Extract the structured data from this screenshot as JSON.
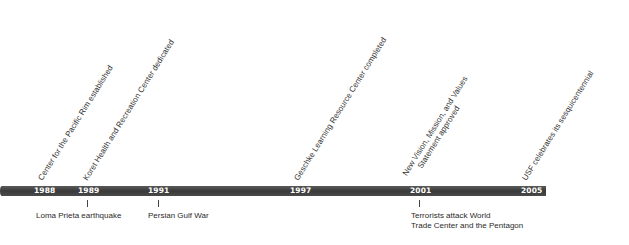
{
  "timeline": {
    "bar_color": "#444444",
    "years": [
      {
        "label": "1988"
      },
      {
        "label": "1989"
      },
      {
        "label": "1991"
      },
      {
        "label": "1997"
      },
      {
        "label": "2001"
      },
      {
        "label": "2005"
      }
    ],
    "events_above": [
      {
        "year": "1988",
        "text": "Center for the Pacific Rim established"
      },
      {
        "year": "1989",
        "text": "Koret Health and Recreation Center dedicated"
      },
      {
        "year": "1997",
        "text": "Geschke Learning Resource Center completed"
      },
      {
        "year": "2001",
        "text_line1": "New Vision, Mission, and Values",
        "text_line2": "Statement approved"
      },
      {
        "year": "2005",
        "text": "USF celebrates its sesquicentennial"
      }
    ],
    "events_below": [
      {
        "year": "1989",
        "text": "Loma Prieta earthquake"
      },
      {
        "year": "1991",
        "text": "Persian Gulf War"
      },
      {
        "year": "2001",
        "text_line1": "Terrorists attack World",
        "text_line2": "Trade Center and the Pentagon"
      }
    ]
  }
}
